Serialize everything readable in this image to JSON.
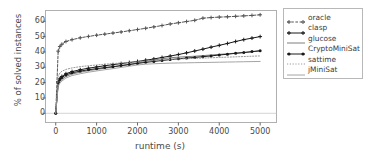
{
  "chart_data": {
    "type": "line",
    "title": "",
    "xlabel": "runtime (s)",
    "ylabel": "% of solved instances",
    "xlim": [
      -250,
      5400
    ],
    "ylim": [
      -6,
      67
    ],
    "xticks": [
      0,
      1000,
      2000,
      3000,
      4000,
      5000
    ],
    "yticks": [
      0,
      10,
      20,
      30,
      40,
      50,
      60
    ],
    "grid": false,
    "legend_position": "right-outside",
    "series": [
      {
        "name": "oracle",
        "color": "#555555",
        "linestyle": "dashed",
        "marker": "plus",
        "x": [
          0,
          60,
          100,
          150,
          250,
          400,
          600,
          800,
          1000,
          1200,
          1400,
          1600,
          1800,
          2000,
          2200,
          2400,
          2600,
          2800,
          3000,
          3200,
          3400,
          3600,
          3800,
          4000,
          4200,
          4400,
          4600,
          4800,
          5000
        ],
        "y": [
          0,
          40.5,
          43.5,
          45.0,
          46.8,
          48.0,
          49.2,
          50.1,
          50.9,
          51.6,
          52.3,
          53.0,
          53.8,
          54.6,
          55.4,
          56.3,
          57.2,
          58.2,
          59.0,
          59.8,
          60.6,
          62.0,
          62.4,
          62.7,
          62.9,
          63.2,
          63.5,
          63.8,
          64.2
        ]
      },
      {
        "name": "clasp",
        "color": "#1a1a1a",
        "linestyle": "solid",
        "marker": "plus",
        "x": [
          0,
          60,
          100,
          150,
          250,
          400,
          600,
          800,
          1000,
          1200,
          1400,
          1600,
          1800,
          2000,
          2200,
          2400,
          2600,
          2800,
          3000,
          3200,
          3400,
          3600,
          3800,
          4000,
          4200,
          4400,
          4600,
          4800,
          5000
        ],
        "y": [
          0,
          20.5,
          22.5,
          24.0,
          25.8,
          27.2,
          28.4,
          29.4,
          30.2,
          31.0,
          31.7,
          32.4,
          33.1,
          33.8,
          34.6,
          35.4,
          36.4,
          37.3,
          38.3,
          39.4,
          40.6,
          41.8,
          43.1,
          44.3,
          45.5,
          46.8,
          48.0,
          49.0,
          50.0
        ]
      },
      {
        "name": "glucose",
        "color": "#6f6f6f",
        "linestyle": "solid",
        "marker": "none",
        "x": [
          0,
          60,
          100,
          150,
          250,
          400,
          600,
          800,
          1000,
          1200,
          1400,
          1600,
          1800,
          2000,
          2200,
          2400,
          2600,
          2800,
          3000,
          3200,
          3400,
          3600,
          3800,
          4000,
          4200,
          4400,
          4600,
          4800,
          5000
        ],
        "y": [
          0,
          18.5,
          20.5,
          22.0,
          24.0,
          25.6,
          26.8,
          27.8,
          28.6,
          29.4,
          30.2,
          31.0,
          31.9,
          32.8,
          33.8,
          34.7,
          35.6,
          36.2,
          36.6,
          36.9,
          37.2,
          37.6,
          38.0,
          38.4,
          38.8,
          39.2,
          39.6,
          40.1,
          40.6
        ]
      },
      {
        "name": "CryptoMiniSat",
        "color": "#1a1a1a",
        "linestyle": "solid",
        "marker": "dot",
        "x": [
          0,
          60,
          100,
          150,
          250,
          400,
          600,
          800,
          1000,
          1200,
          1400,
          1600,
          1800,
          2000,
          2200,
          2400,
          2600,
          2800,
          3000,
          3200,
          3400,
          3600,
          3800,
          4000,
          4200,
          4400,
          4600,
          4800,
          5000
        ],
        "y": [
          0,
          20.0,
          22.0,
          23.4,
          25.0,
          26.4,
          27.5,
          28.4,
          29.1,
          29.8,
          30.4,
          31.1,
          31.8,
          32.5,
          33.2,
          33.8,
          34.4,
          35.0,
          35.5,
          36.0,
          36.4,
          36.9,
          37.4,
          38.0,
          38.5,
          39.1,
          39.6,
          40.2,
          40.8
        ]
      },
      {
        "name": "sattime",
        "color": "#8f8f8f",
        "linestyle": "dotted",
        "marker": "none",
        "x": [
          0,
          60,
          100,
          150,
          250,
          400,
          600,
          800,
          1000,
          1200,
          1400,
          1600,
          1800,
          2000,
          2200,
          2400,
          2600,
          2800,
          3000,
          3200,
          3400,
          3600,
          3800,
          4000,
          4200,
          4400,
          4600,
          4800,
          5000
        ],
        "y": [
          0,
          24.0,
          26.2,
          27.4,
          28.6,
          29.6,
          30.4,
          31.0,
          31.5,
          32.0,
          32.4,
          32.8,
          33.2,
          33.6,
          34.0,
          34.4,
          34.8,
          35.1,
          35.4,
          35.6,
          35.8,
          36.0,
          36.2,
          36.4,
          36.6,
          36.8,
          37.0,
          37.2,
          37.4
        ]
      },
      {
        "name": "jMiniSat",
        "color": "#9a9a9a",
        "linestyle": "solid",
        "marker": "none",
        "x": [
          0,
          60,
          100,
          150,
          250,
          400,
          600,
          800,
          1000,
          1200,
          1400,
          1600,
          1800,
          2000,
          2200,
          2400,
          2600,
          2800,
          3000,
          3200,
          3400,
          3600,
          3800,
          4000,
          4200,
          4400,
          4600,
          4800,
          5000
        ],
        "y": [
          0,
          17.5,
          19.5,
          21.0,
          23.0,
          24.6,
          25.8,
          26.8,
          27.6,
          28.4,
          29.1,
          29.9,
          30.7,
          31.5,
          32.0,
          32.3,
          32.5,
          32.7,
          32.8,
          32.9,
          33.0,
          33.1,
          33.2,
          33.3,
          33.4,
          33.5,
          33.6,
          33.7,
          33.8
        ]
      }
    ]
  },
  "axes": {
    "ylabel": "% of solved instances",
    "xlabel": "runtime (s)",
    "ytick_labels": [
      "0",
      "10",
      "20",
      "30",
      "40",
      "50",
      "60"
    ],
    "xtick_labels": [
      "0",
      "1000",
      "2000",
      "3000",
      "4000",
      "5000"
    ]
  },
  "legend": {
    "items": [
      {
        "label": "oracle"
      },
      {
        "label": "clasp"
      },
      {
        "label": "glucose"
      },
      {
        "label": "CryptoMiniSat"
      },
      {
        "label": "sattime"
      },
      {
        "label": "jMiniSat"
      }
    ]
  },
  "colors": {
    "axis": "#555555",
    "frame": "#b0b0b0",
    "background": "#ffffff"
  }
}
